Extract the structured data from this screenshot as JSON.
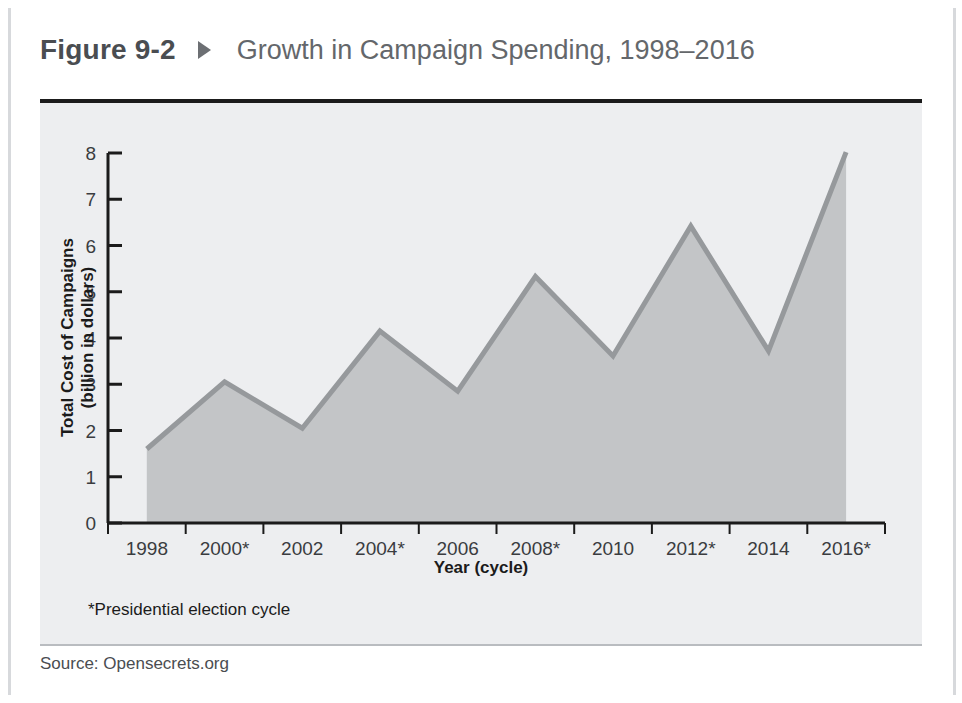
{
  "figure": {
    "label": "Figure 9-2",
    "marker_icon": "right-triangle-icon",
    "title": "Growth in Campaign Spending, 1998–2016",
    "source": "Source: Opensecrets.org",
    "footnote": "*Presidential election cycle"
  },
  "colors": {
    "panel_background": "#edeef0",
    "area_fill": "#c3c5c7",
    "line": "#96999c",
    "axis": "#1b1b1b",
    "title_text": "#64676b",
    "label_text": "#1b1b1b",
    "frame_rule": "#d7d9dc"
  },
  "chart_data": {
    "type": "area",
    "title": "Growth in Campaign Spending, 1998–2016",
    "xlabel": "Year (cycle)",
    "ylabel": "Total Cost of Campaigns\n(billion in dollars)",
    "ylabel_line1": "Total Cost of Campaigns",
    "ylabel_line2": "(billion in dollars)",
    "categories": [
      "1998",
      "2000*",
      "2002",
      "2004*",
      "2006",
      "2008*",
      "2010",
      "2012*",
      "2014",
      "2016*"
    ],
    "values": [
      1.6,
      3.05,
      2.05,
      4.15,
      2.85,
      5.33,
      3.61,
      6.42,
      3.72,
      8.02
    ],
    "ylim": [
      0,
      8
    ],
    "yticks": [
      0,
      1,
      2,
      3,
      4,
      5,
      6,
      7,
      8
    ],
    "ytick_labels": [
      "0",
      "1",
      "2",
      "3",
      "4",
      "5",
      "6",
      "7",
      "8"
    ],
    "grid": false,
    "legend": null,
    "annotations": [
      "*Presidential election cycle"
    ]
  }
}
